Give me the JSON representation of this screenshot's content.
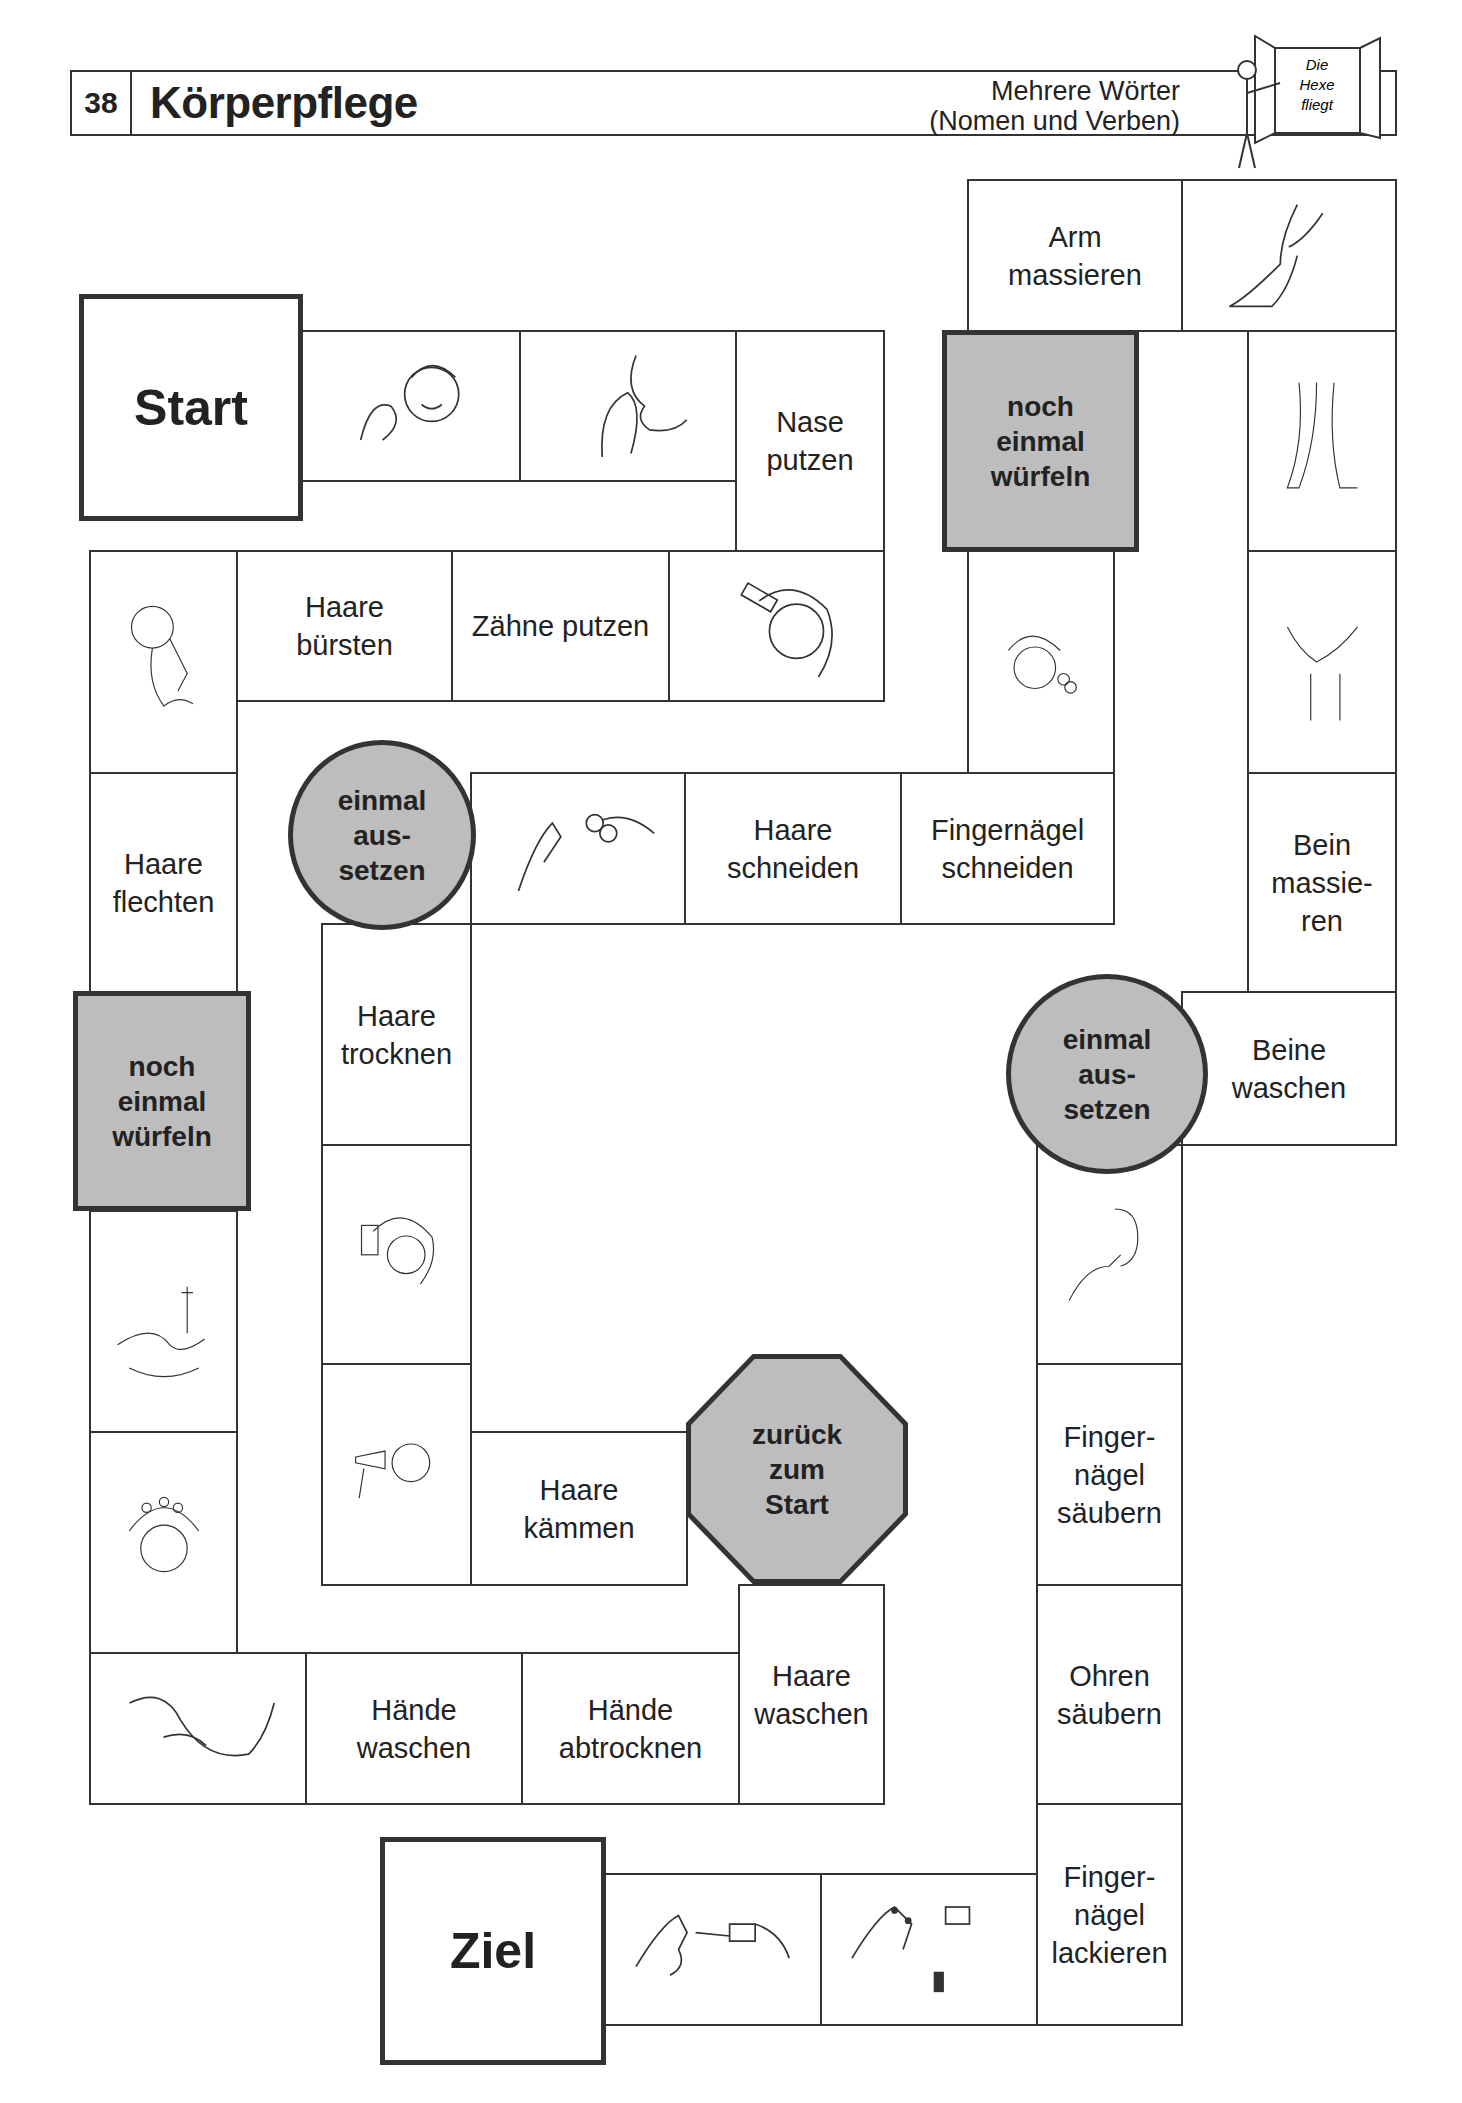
{
  "header": {
    "page_number": "38",
    "title": "Körperpflege",
    "subtitle_line1": "Mehrere Wörter",
    "subtitle_line2": "(Nomen und Verben)",
    "logo_text": "Die\nHexe\nfliegt"
  },
  "colors": {
    "special_field": "#bdbdbd",
    "border": "#333333"
  },
  "board": {
    "start": "Start",
    "goal": "Ziel",
    "fields": {
      "nase_putzen": "Nase\nputzen",
      "haare_buersten": "Haare\nbürsten",
      "zaehne_putzen": "Zähne putzen",
      "haare_flechten": "Haare\nflechten",
      "noch_einmal_left": "noch\neinmal\nwürfeln",
      "haende_waschen": "Hände\nwaschen",
      "haende_abtrocknen": "Hände\nabtrocknen",
      "haare_waschen": "Haare\nwaschen",
      "zurueck_zum_start": "zurück\nzum\nStart",
      "haare_kaemmen": "Haare\nkämmen",
      "haare_trocknen": "Haare\ntrocknen",
      "einmal_aussetzen_left": "einmal\naus-\nsetzen",
      "haare_schneiden": "Haare\nschneiden",
      "fingernaegel_schneiden": "Fingernägel\nschneiden",
      "noch_einmal_right": "noch\neinmal\nwürfeln",
      "arm_massieren": "Arm\nmassieren",
      "bein_massieren": "Bein\nmassie-\nren",
      "beine_waschen": "Beine\nwaschen",
      "einmal_aussetzen_right": "einmal\naus-\nsetzen",
      "fingernaegel_saeubern": "Finger-\nnägel\nsäubern",
      "ohren_saeubern": "Ohren\nsäubern",
      "fingernaegel_lackieren": "Finger-\nnägel\nlackieren"
    },
    "pictures": [
      "nose-blowing-boy",
      "nose-blowing-closeup",
      "hair-brushing-girl",
      "hair-braiding",
      "hand-washing-basin",
      "hair-washing-shampoo",
      "hands-drying-towel",
      "hair-drying-dryer",
      "hair-combing",
      "hair-cutting-scissors",
      "nail-cutting",
      "hair-cutting-girl",
      "leg-massage",
      "legs-showering",
      "leg-washing-hands",
      "ear-cleaning",
      "nail-polish-applying",
      "nail-polish-bottle"
    ]
  }
}
